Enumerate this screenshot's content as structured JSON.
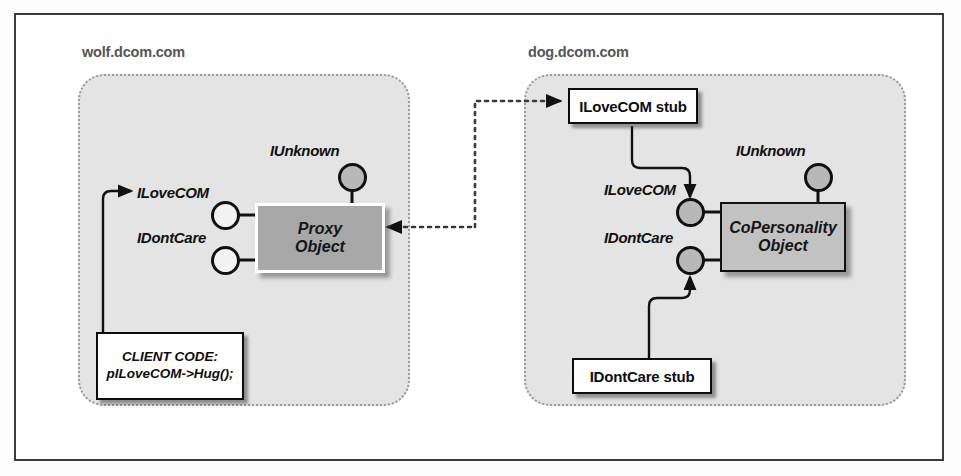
{
  "diagram": {
    "hosts": [
      {
        "id": "wolf",
        "label": "wolf.dcom.com"
      },
      {
        "id": "dog",
        "label": "dog.dcom.com"
      }
    ],
    "objects": [
      {
        "id": "proxy",
        "line1": "Proxy",
        "line2": "Object"
      },
      {
        "id": "copersonality",
        "line1": "CoPersonality",
        "line2": "Object"
      }
    ],
    "stubs": [
      {
        "id": "ilovecom-stub",
        "label": "ILoveCOM stub"
      },
      {
        "id": "idontcare-stub",
        "label": "IDontCare stub"
      }
    ],
    "client_code": {
      "line1": "CLIENT CODE:",
      "line2": "pILoveCOM->Hug();"
    },
    "interfaces": {
      "left": {
        "iunknown": "IUnknown",
        "ilovecom": "ILoveCOM",
        "idontcare": "IDontCare"
      },
      "right": {
        "iunknown": "IUnknown",
        "ilovecom": "ILoveCOM",
        "idontcare": "IDontCare"
      }
    },
    "colors": {
      "frame_border": "#3a3a3a",
      "host_fill": "#e4e4e4",
      "host_border": "#9a9a9a",
      "host_label_text": "#555555",
      "proxy_fill": "#a8a8a8",
      "object_fill": "#c2c2c2",
      "stub_fill": "#ffffff",
      "line": "#1a1a1a"
    }
  }
}
